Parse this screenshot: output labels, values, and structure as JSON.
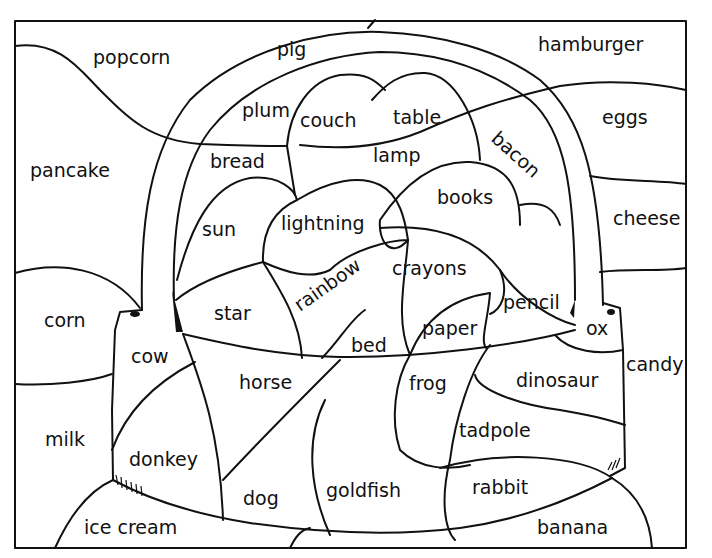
{
  "worksheet": {
    "type": "color-by-category picture (basket)",
    "border_color": "#111111",
    "background": "#ffffff",
    "regions": [
      {
        "id": "popcorn",
        "label": "popcorn",
        "x": 93,
        "y": 64
      },
      {
        "id": "pig",
        "label": "pig",
        "x": 277,
        "y": 56
      },
      {
        "id": "hamburger",
        "label": "hamburger",
        "x": 538,
        "y": 51
      },
      {
        "id": "plum",
        "label": "plum",
        "x": 242,
        "y": 117
      },
      {
        "id": "couch",
        "label": "couch",
        "x": 300,
        "y": 127
      },
      {
        "id": "table",
        "label": "table",
        "x": 393,
        "y": 124
      },
      {
        "id": "eggs",
        "label": "eggs",
        "x": 602,
        "y": 124
      },
      {
        "id": "pancake",
        "label": "pancake",
        "x": 30,
        "y": 177
      },
      {
        "id": "bread",
        "label": "bread",
        "x": 210,
        "y": 168
      },
      {
        "id": "lamp",
        "label": "lamp",
        "x": 373,
        "y": 162
      },
      {
        "id": "bacon",
        "label": "bacon",
        "x": 490,
        "y": 140,
        "rotate": 42
      },
      {
        "id": "books",
        "label": "books",
        "x": 437,
        "y": 204
      },
      {
        "id": "cheese",
        "label": "cheese",
        "x": 613,
        "y": 225
      },
      {
        "id": "sun",
        "label": "sun",
        "x": 202,
        "y": 236
      },
      {
        "id": "lightning",
        "label": "lightning",
        "x": 281,
        "y": 230
      },
      {
        "id": "crayons",
        "label": "crayons",
        "x": 392,
        "y": 275
      },
      {
        "id": "rainbow",
        "label": "rainbow",
        "x": 300,
        "y": 312,
        "rotate": -35
      },
      {
        "id": "pencil",
        "label": "pencil",
        "x": 503,
        "y": 309
      },
      {
        "id": "corn",
        "label": "corn",
        "x": 44,
        "y": 327
      },
      {
        "id": "star",
        "label": "star",
        "x": 214,
        "y": 320
      },
      {
        "id": "paper",
        "label": "paper",
        "x": 422,
        "y": 335
      },
      {
        "id": "ox",
        "label": "ox",
        "x": 586,
        "y": 335
      },
      {
        "id": "bed",
        "label": "bed",
        "x": 351,
        "y": 352
      },
      {
        "id": "cow",
        "label": "cow",
        "x": 131,
        "y": 363
      },
      {
        "id": "candy",
        "label": "candy",
        "x": 626,
        "y": 371
      },
      {
        "id": "horse",
        "label": "horse",
        "x": 239,
        "y": 389
      },
      {
        "id": "frog",
        "label": "frog",
        "x": 409,
        "y": 390
      },
      {
        "id": "dinosaur",
        "label": "dinosaur",
        "x": 516,
        "y": 387
      },
      {
        "id": "milk",
        "label": "milk",
        "x": 45,
        "y": 446
      },
      {
        "id": "tadpole",
        "label": "tadpole",
        "x": 459,
        "y": 437
      },
      {
        "id": "donkey",
        "label": "donkey",
        "x": 129,
        "y": 466
      },
      {
        "id": "goldfish",
        "label": "goldfish",
        "x": 326,
        "y": 497
      },
      {
        "id": "rabbit",
        "label": "rabbit",
        "x": 472,
        "y": 494
      },
      {
        "id": "dog",
        "label": "dog",
        "x": 243,
        "y": 505
      },
      {
        "id": "ice-cream",
        "label": "ice cream",
        "x": 84,
        "y": 534
      },
      {
        "id": "banana",
        "label": "banana",
        "x": 537,
        "y": 534
      }
    ]
  }
}
